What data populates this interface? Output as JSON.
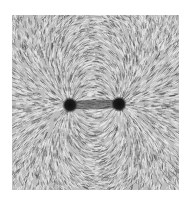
{
  "image": {
    "subject": "iron filings showing magnetic field lines around two poles",
    "style": "grayscale photograph",
    "colors": {
      "background": "#ffffff",
      "filings_light": "#d8d8d8",
      "filings_dark": "#3a3a3a",
      "pole": "#151515"
    },
    "poles": [
      {
        "name": "left-pole"
      },
      {
        "name": "right-pole"
      }
    ]
  }
}
